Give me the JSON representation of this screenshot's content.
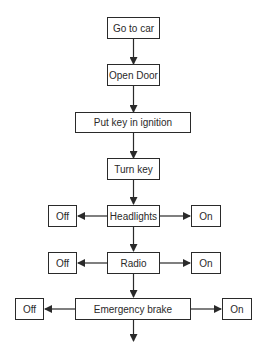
{
  "diagram": {
    "type": "flowchart",
    "nodes": {
      "go_to_car": "Go to car",
      "open_door": "Open Door",
      "put_key": "Put key in ignition",
      "turn_key": "Turn key",
      "headlights": "Headlights",
      "headlights_off": "Off",
      "headlights_on": "On",
      "radio": "Radio",
      "radio_off": "Off",
      "radio_on": "On",
      "emergency_brake": "Emergency brake",
      "brake_off": "Off",
      "brake_on": "On"
    },
    "edges": [
      [
        "Go to car",
        "Open Door"
      ],
      [
        "Open Door",
        "Put key in ignition"
      ],
      [
        "Put key in ignition",
        "Turn key"
      ],
      [
        "Turn key",
        "Headlights"
      ],
      [
        "Headlights",
        "Off"
      ],
      [
        "Headlights",
        "On"
      ],
      [
        "Headlights",
        "Radio"
      ],
      [
        "Radio",
        "Off"
      ],
      [
        "Radio",
        "On"
      ],
      [
        "Radio",
        "Emergency brake"
      ],
      [
        "Emergency brake",
        "Off"
      ],
      [
        "Emergency brake",
        "On"
      ],
      [
        "Emergency brake",
        "(continues)"
      ]
    ],
    "colors": {
      "line": "#2a2a2a",
      "background": "#ffffff"
    }
  }
}
